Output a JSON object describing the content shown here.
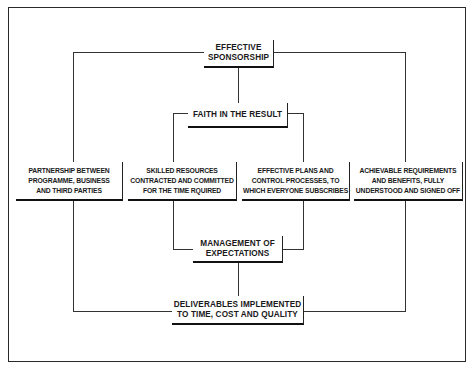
{
  "diagram": {
    "type": "flow",
    "nodes": {
      "sponsorship": {
        "label": "EFFECTIVE\nSPONSORSHIP"
      },
      "faith": {
        "label": "FAITH IN THE RESULT"
      },
      "partnership": {
        "label": "PARTNERSHIP BETWEEN\nPROGRAMME, BUSINESS\nAND THIRD PARTIES"
      },
      "skilled": {
        "label": "SKILLED RESOURCES\nCONTRACTED AND COMMITTED\nFOR THE TIME RQUIRED"
      },
      "plans": {
        "label": "EFFECTIVE PLANS AND\nCONTROL PROCESSES, TO\nWHICH EVERYONE SUBSCRIBES"
      },
      "requirements": {
        "label": "ACHIEVABLE REQUIREMENTS\nAND BENEFITS, FULLY\nUNDERSTOOD AND SIGNED OFF"
      },
      "expectations": {
        "label": "MANAGEMENT OF\nEXPECTATIONS"
      },
      "deliverables": {
        "label": "DELIVERABLES IMPLEMENTED\nTO TIME, COST AND QUALITY"
      }
    },
    "edges": [
      {
        "from": "sponsorship",
        "to": "faith"
      },
      {
        "from": "sponsorship",
        "to": "partnership"
      },
      {
        "from": "sponsorship",
        "to": "requirements"
      },
      {
        "from": "faith",
        "to": "skilled"
      },
      {
        "from": "faith",
        "to": "plans"
      },
      {
        "from": "skilled",
        "to": "expectations"
      },
      {
        "from": "plans",
        "to": "expectations"
      },
      {
        "from": "expectations",
        "to": "deliverables"
      },
      {
        "from": "partnership",
        "to": "deliverables"
      },
      {
        "from": "requirements",
        "to": "deliverables"
      }
    ]
  }
}
